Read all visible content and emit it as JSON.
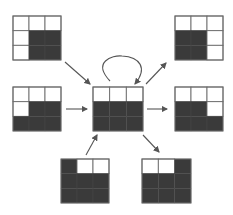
{
  "diagram": {
    "type": "state-transition",
    "colors": {
      "filled": "#3a3a3a",
      "empty": "#ffffff",
      "border": "#6a6a6a",
      "arrow": "#555555"
    },
    "grid_size": 3,
    "center": {
      "id": "center",
      "x": 93,
      "y": 87,
      "w": 50,
      "h": 44,
      "cells": [
        [
          0,
          0,
          0
        ],
        [
          1,
          1,
          1
        ],
        [
          1,
          1,
          1
        ]
      ],
      "self_loop": true
    },
    "nodes": [
      {
        "id": "top-left",
        "x": 13,
        "y": 16,
        "w": 48,
        "h": 44,
        "cells": [
          [
            0,
            0,
            0
          ],
          [
            0,
            1,
            1
          ],
          [
            0,
            1,
            1
          ]
        ],
        "edge": "in"
      },
      {
        "id": "middle-left",
        "x": 13,
        "y": 87,
        "w": 48,
        "h": 44,
        "cells": [
          [
            0,
            0,
            0
          ],
          [
            0,
            1,
            1
          ],
          [
            1,
            1,
            1
          ]
        ],
        "edge": "in"
      },
      {
        "id": "bottom-left",
        "x": 61,
        "y": 159,
        "w": 48,
        "h": 44,
        "cells": [
          [
            1,
            0,
            0
          ],
          [
            1,
            1,
            1
          ],
          [
            1,
            1,
            1
          ]
        ],
        "edge": "in"
      },
      {
        "id": "top-right",
        "x": 175,
        "y": 16,
        "w": 48,
        "h": 44,
        "cells": [
          [
            0,
            0,
            0
          ],
          [
            1,
            1,
            0
          ],
          [
            1,
            1,
            0
          ]
        ],
        "edge": "out"
      },
      {
        "id": "middle-right",
        "x": 175,
        "y": 87,
        "w": 48,
        "h": 44,
        "cells": [
          [
            0,
            0,
            0
          ],
          [
            1,
            1,
            0
          ],
          [
            1,
            1,
            1
          ]
        ],
        "edge": "out"
      },
      {
        "id": "bottom-right",
        "x": 142,
        "y": 159,
        "w": 49,
        "h": 44,
        "cells": [
          [
            0,
            0,
            1
          ],
          [
            1,
            1,
            1
          ],
          [
            1,
            1,
            1
          ]
        ],
        "edge": "out"
      }
    ],
    "arrows": [
      {
        "id": "arrow-top-left-to-center",
        "x1": 65,
        "y1": 62,
        "x2": 90,
        "y2": 84
      },
      {
        "id": "arrow-middle-left-to-center",
        "x1": 66,
        "y1": 109,
        "x2": 87,
        "y2": 109
      },
      {
        "id": "arrow-bottom-left-to-center",
        "x1": 86,
        "y1": 155,
        "x2": 97,
        "y2": 135
      },
      {
        "id": "arrow-center-to-top-right",
        "x1": 146,
        "y1": 84,
        "x2": 166,
        "y2": 63
      },
      {
        "id": "arrow-center-to-middle-right",
        "x1": 147,
        "y1": 109,
        "x2": 167,
        "y2": 109
      },
      {
        "id": "arrow-center-to-bottom-right",
        "x1": 143,
        "y1": 135,
        "x2": 159,
        "y2": 152
      }
    ],
    "loop": {
      "path": "M 110 81 C 92 62, 112 55, 122 56 C 140 57, 148 68, 135 84"
    }
  }
}
